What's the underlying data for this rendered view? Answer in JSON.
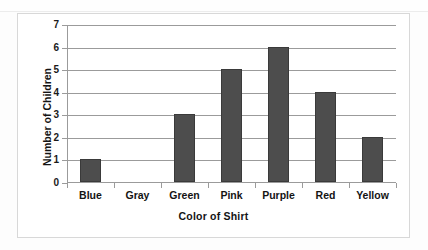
{
  "chart_data": {
    "type": "bar",
    "title": "",
    "xlabel": "Color of Shirt",
    "ylabel": "Number of Children",
    "categories": [
      "Blue",
      "Gray",
      "Green",
      "Pink",
      "Purple",
      "Red",
      "Yellow"
    ],
    "values": [
      1,
      0,
      3,
      5,
      6,
      4,
      2
    ],
    "ylim": [
      0,
      7
    ],
    "ytick_labels": [
      "0",
      "1",
      "2",
      "3",
      "4",
      "5",
      "6",
      "7"
    ],
    "ytick_values": [
      0,
      1,
      2,
      3,
      4,
      5,
      6,
      7
    ],
    "grid": "horizontal",
    "legend": "none",
    "bar_color": "#4d4d4d",
    "gridline_color": "#9b9b9b",
    "axis_color": "#9b9b9b",
    "frame_color": "#d8d8d8",
    "background": "#ffffff"
  }
}
